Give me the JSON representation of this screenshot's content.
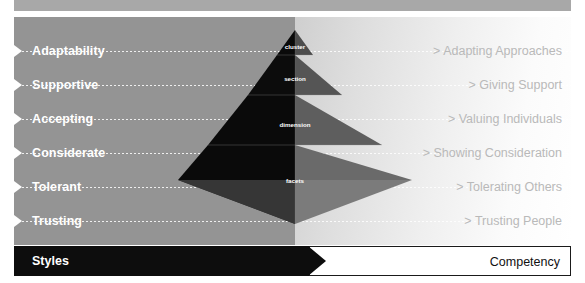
{
  "diagram": {
    "rows": [
      {
        "style": "Adaptability",
        "competency": "> Adapting Approaches"
      },
      {
        "style": "Supportive",
        "competency": "> Giving Support"
      },
      {
        "style": "Accepting",
        "competency": "> Valuing Individuals"
      },
      {
        "style": "Considerate",
        "competency": "> Showing Consideration"
      },
      {
        "style": "Tolerant",
        "competency": "> Tolerating Others"
      },
      {
        "style": "Trusting",
        "competency": "> Trusting People"
      }
    ],
    "pyramid": {
      "levels": [
        {
          "label": "cluster"
        },
        {
          "label": "section"
        },
        {
          "label": "dimension"
        },
        {
          "label": "facets"
        }
      ]
    },
    "footer": {
      "left_label": "Styles",
      "right_label": "Competency"
    },
    "colors": {
      "left_panel": "#949494",
      "right_panel_start": "#cfcfcf",
      "right_panel_end": "#ffffff",
      "pyramid_dark": "#0a0a0a",
      "pyramid_mid": "#6f6f6f",
      "pyramid_base_left": "#3a3a3a",
      "pyramid_base_right": "#808080",
      "footer_black": "#0d0d0d",
      "footer_white": "#ffffff",
      "style_text": "#ffffff",
      "competency_text": "#b9b9b9"
    }
  }
}
